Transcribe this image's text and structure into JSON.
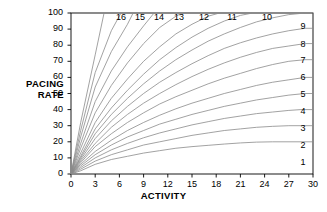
{
  "chart_data": {
    "type": "line",
    "title": "",
    "xlabel": "ACTIVITY",
    "ylabel": "PACING RATE",
    "xlim": [
      0,
      30
    ],
    "ylim": [
      0,
      100
    ],
    "xticks": [
      0,
      3,
      6,
      9,
      12,
      15,
      18,
      21,
      24,
      27,
      30
    ],
    "yticks": [
      0,
      10,
      20,
      30,
      40,
      50,
      60,
      70,
      80,
      90,
      100
    ],
    "grid": false,
    "legend": "inline-curve-labels",
    "line_color": "#8a8a8a",
    "frame_color": "#000000",
    "background": "#ffffff",
    "series": [
      {
        "name": "1",
        "label_pos": "right",
        "points": [
          [
            0,
            0
          ],
          [
            1.2,
            2
          ],
          [
            3,
            6
          ],
          [
            5,
            9
          ],
          [
            7,
            11
          ],
          [
            9,
            13
          ],
          [
            11,
            14.5
          ],
          [
            13,
            16
          ],
          [
            15,
            17
          ],
          [
            17,
            17.8
          ],
          [
            19,
            18.6
          ],
          [
            21,
            19.3
          ],
          [
            23,
            19.8
          ],
          [
            25,
            20
          ],
          [
            30,
            20
          ]
        ]
      },
      {
        "name": "2",
        "label_pos": "right",
        "points": [
          [
            0,
            0
          ],
          [
            1.2,
            3
          ],
          [
            3,
            8
          ],
          [
            5,
            12
          ],
          [
            7,
            15
          ],
          [
            9,
            18
          ],
          [
            11,
            20
          ],
          [
            13,
            22
          ],
          [
            15,
            24
          ],
          [
            17,
            25.5
          ],
          [
            19,
            27
          ],
          [
            21,
            28
          ],
          [
            23,
            29
          ],
          [
            25,
            29.6
          ],
          [
            27,
            30
          ],
          [
            30,
            30
          ]
        ]
      },
      {
        "name": "3",
        "label_pos": "right",
        "points": [
          [
            0,
            0
          ],
          [
            1.2,
            4
          ],
          [
            3,
            10
          ],
          [
            5,
            15
          ],
          [
            7,
            19
          ],
          [
            9,
            22.5
          ],
          [
            11,
            25.5
          ],
          [
            13,
            28
          ],
          [
            15,
            30.5
          ],
          [
            17,
            32.5
          ],
          [
            19,
            34.5
          ],
          [
            21,
            36
          ],
          [
            23,
            37.5
          ],
          [
            25,
            38.5
          ],
          [
            27,
            39.5
          ],
          [
            28.5,
            40
          ],
          [
            30,
            40
          ]
        ]
      },
      {
        "name": "4",
        "label_pos": "right",
        "points": [
          [
            0,
            0
          ],
          [
            1.2,
            5
          ],
          [
            3,
            12
          ],
          [
            5,
            18
          ],
          [
            7,
            23
          ],
          [
            9,
            27
          ],
          [
            11,
            31
          ],
          [
            13,
            34
          ],
          [
            15,
            37
          ],
          [
            17,
            39.5
          ],
          [
            19,
            42
          ],
          [
            21,
            44
          ],
          [
            23,
            46
          ],
          [
            25,
            47.5
          ],
          [
            27,
            49
          ],
          [
            29,
            50
          ],
          [
            30,
            50
          ]
        ]
      },
      {
        "name": "5",
        "label_pos": "right",
        "points": [
          [
            0,
            0
          ],
          [
            1.2,
            6
          ],
          [
            3,
            14
          ],
          [
            5,
            21
          ],
          [
            7,
            27
          ],
          [
            9,
            32
          ],
          [
            11,
            36.5
          ],
          [
            13,
            40.5
          ],
          [
            15,
            44
          ],
          [
            17,
            47
          ],
          [
            19,
            50
          ],
          [
            21,
            52.5
          ],
          [
            23,
            55
          ],
          [
            25,
            57
          ],
          [
            27,
            58.5
          ],
          [
            29,
            60
          ],
          [
            30,
            60
          ]
        ]
      },
      {
        "name": "6",
        "label_pos": "right",
        "points": [
          [
            0,
            0
          ],
          [
            1.2,
            7
          ],
          [
            3,
            17
          ],
          [
            5,
            25
          ],
          [
            7,
            32
          ],
          [
            9,
            38
          ],
          [
            11,
            43.5
          ],
          [
            13,
            48
          ],
          [
            15,
            52
          ],
          [
            17,
            56
          ],
          [
            19,
            59.5
          ],
          [
            21,
            62.5
          ],
          [
            23,
            65.5
          ],
          [
            25,
            68
          ],
          [
            27,
            70
          ],
          [
            29,
            71
          ],
          [
            30,
            71
          ]
        ]
      },
      {
        "name": "7",
        "label_pos": "right",
        "points": [
          [
            0,
            0
          ],
          [
            1.2,
            8
          ],
          [
            3,
            19
          ],
          [
            5,
            29
          ],
          [
            7,
            37
          ],
          [
            9,
            44
          ],
          [
            11,
            50
          ],
          [
            13,
            55.5
          ],
          [
            15,
            60.5
          ],
          [
            17,
            65
          ],
          [
            19,
            69
          ],
          [
            21,
            72.5
          ],
          [
            23,
            75.5
          ],
          [
            25,
            78
          ],
          [
            27,
            79.5
          ],
          [
            29,
            81
          ],
          [
            30,
            81
          ]
        ]
      },
      {
        "name": "8",
        "label_pos": "right",
        "points": [
          [
            0,
            0
          ],
          [
            1.2,
            9
          ],
          [
            3,
            22
          ],
          [
            5,
            33
          ],
          [
            7,
            42
          ],
          [
            9,
            50
          ],
          [
            11,
            57
          ],
          [
            13,
            63
          ],
          [
            15,
            68.5
          ],
          [
            17,
            73.5
          ],
          [
            19,
            78
          ],
          [
            21,
            81.5
          ],
          [
            23,
            84.5
          ],
          [
            25,
            87
          ],
          [
            27,
            89
          ],
          [
            29,
            90.5
          ],
          [
            30,
            90.5
          ]
        ]
      },
      {
        "name": "9",
        "label_pos": "right",
        "points": [
          [
            0,
            0
          ],
          [
            1.2,
            10
          ],
          [
            3,
            25
          ],
          [
            5,
            37
          ],
          [
            7,
            47
          ],
          [
            9,
            56
          ],
          [
            11,
            64
          ],
          [
            13,
            71
          ],
          [
            15,
            77
          ],
          [
            17,
            82.5
          ],
          [
            19,
            87
          ],
          [
            21,
            91
          ],
          [
            23,
            94.5
          ],
          [
            25,
            97
          ],
          [
            27,
            99
          ],
          [
            29,
            100
          ],
          [
            30,
            100
          ]
        ]
      },
      {
        "name": "10",
        "label_pos": "top",
        "points": [
          [
            0,
            0
          ],
          [
            1.2,
            11
          ],
          [
            3,
            28
          ],
          [
            5,
            41
          ],
          [
            7,
            52
          ],
          [
            9,
            62
          ],
          [
            11,
            71
          ],
          [
            13,
            78.5
          ],
          [
            15,
            85
          ],
          [
            17,
            90.5
          ],
          [
            19,
            95
          ],
          [
            21,
            98.5
          ],
          [
            22.5,
            100
          ]
        ]
      },
      {
        "name": "11",
        "label_pos": "top",
        "points": [
          [
            0,
            0
          ],
          [
            1.2,
            13
          ],
          [
            3,
            32
          ],
          [
            5,
            47
          ],
          [
            7,
            59
          ],
          [
            9,
            70
          ],
          [
            11,
            79
          ],
          [
            13,
            87
          ],
          [
            15,
            93
          ],
          [
            17,
            98
          ],
          [
            18.4,
            100
          ]
        ]
      },
      {
        "name": "12",
        "label_pos": "top",
        "points": [
          [
            0,
            0
          ],
          [
            1.2,
            16
          ],
          [
            3,
            38
          ],
          [
            5,
            55
          ],
          [
            7,
            69
          ],
          [
            9,
            81
          ],
          [
            11,
            91
          ],
          [
            13,
            98
          ],
          [
            13.8,
            100
          ]
        ]
      },
      {
        "name": "13",
        "label_pos": "top",
        "points": [
          [
            0,
            0
          ],
          [
            1.2,
            19
          ],
          [
            3,
            45
          ],
          [
            5,
            64
          ],
          [
            7,
            79
          ],
          [
            9,
            92
          ],
          [
            10.3,
            100
          ]
        ]
      },
      {
        "name": "14",
        "label_pos": "top",
        "points": [
          [
            0,
            0
          ],
          [
            1.2,
            23
          ],
          [
            3,
            54
          ],
          [
            5,
            76
          ],
          [
            7,
            93
          ],
          [
            7.7,
            100
          ]
        ]
      },
      {
        "name": "15",
        "label_pos": "top",
        "points": [
          [
            0,
            0
          ],
          [
            1.2,
            27
          ],
          [
            3,
            63
          ],
          [
            5,
            89
          ],
          [
            6.2,
            100
          ]
        ]
      },
      {
        "name": "16",
        "label_pos": "top",
        "points": [
          [
            0,
            0
          ],
          [
            1.2,
            32
          ],
          [
            3,
            74
          ],
          [
            4.1,
            100
          ]
        ]
      }
    ],
    "curve_labels_top": [
      "16",
      "15",
      "14",
      "13",
      "12",
      "11",
      "10"
    ],
    "curve_labels_right": [
      "9",
      "8",
      "7",
      "6",
      "5",
      "4",
      "3",
      "2",
      "1"
    ]
  },
  "layout": {
    "plot_left": 71,
    "plot_right": 313,
    "plot_top": 13,
    "plot_bottom": 174,
    "top_label_x": [
      121,
      140,
      159,
      179,
      204,
      232,
      267
    ],
    "top_label_y": 12,
    "right_label_x": [
      303,
      303,
      303,
      303,
      303,
      303,
      303,
      303,
      303
    ],
    "right_label_y": [
      26,
      44,
      60,
      77,
      94,
      111,
      128,
      145,
      162
    ]
  }
}
